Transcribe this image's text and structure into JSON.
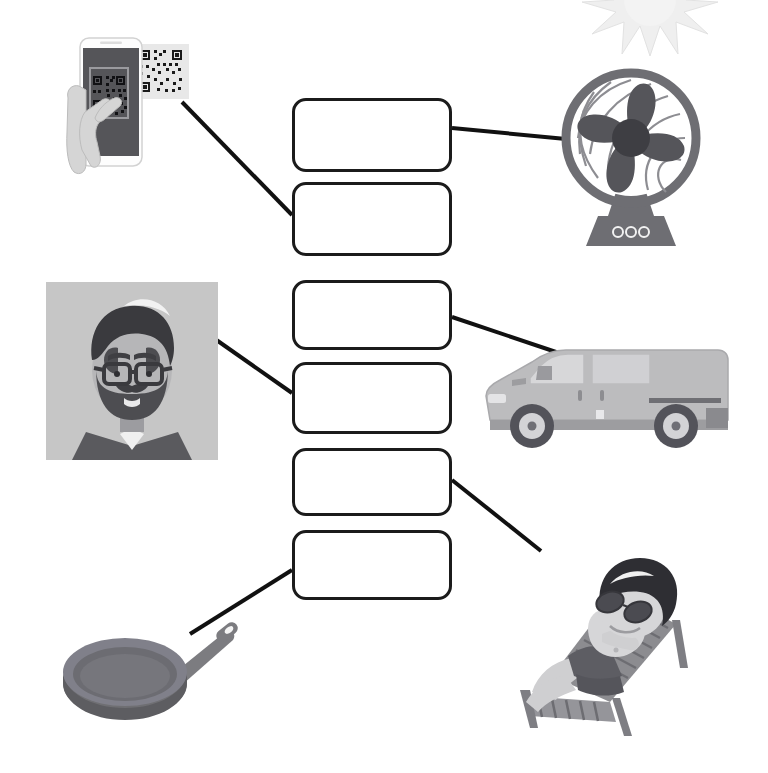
{
  "worksheet": {
    "title": "Matching exercise worksheet",
    "description": "Six empty rounded answer boxes arranged in a central column, joined by straight connector lines to six pictures: three on the left side and three on the right side.",
    "background_color": "#ffffff",
    "box_border_color": "#1b1b1b",
    "line_color": "#111111"
  },
  "answer_boxes": [
    {
      "id": "box-1",
      "label": "",
      "placeholder": "",
      "x": 292,
      "y": 98,
      "w": 160,
      "h": 74
    },
    {
      "id": "box-2",
      "label": "",
      "placeholder": "",
      "x": 292,
      "y": 182,
      "w": 160,
      "h": 74
    },
    {
      "id": "box-3",
      "label": "",
      "placeholder": "",
      "x": 292,
      "y": 280,
      "w": 160,
      "h": 70
    },
    {
      "id": "box-4",
      "label": "",
      "placeholder": "",
      "x": 292,
      "y": 362,
      "w": 160,
      "h": 72
    },
    {
      "id": "box-5",
      "label": "",
      "placeholder": "",
      "x": 292,
      "y": 448,
      "w": 160,
      "h": 68
    },
    {
      "id": "box-6",
      "label": "",
      "placeholder": "",
      "x": 292,
      "y": 530,
      "w": 160,
      "h": 70
    }
  ],
  "pictures": [
    {
      "id": "qr-phone",
      "name": "hand-scanning-qr-code-with-smartphone",
      "side": "left",
      "alt_text": "A hand holding a smartphone scanning a QR code",
      "x": 62,
      "y": 32,
      "w": 135,
      "h": 146
    },
    {
      "id": "hipster-man",
      "name": "bearded-man-with-glasses-portrait",
      "side": "left",
      "alt_text": "Portrait of a bearded man wearing glasses on a grey square",
      "x": 46,
      "y": 282,
      "w": 172,
      "h": 178
    },
    {
      "id": "frying-pan",
      "name": "frying-pan",
      "side": "left",
      "alt_text": "A grey frying pan seen at an angle",
      "x": 55,
      "y": 608,
      "w": 200,
      "h": 120
    },
    {
      "id": "sun",
      "name": "sun-star-burst",
      "side": "right",
      "alt_text": "A pale sun / star burst shape in the top right corner",
      "x": 585,
      "y": -18,
      "w": 130,
      "h": 70
    },
    {
      "id": "table-fan",
      "name": "electric-table-fan",
      "side": "right",
      "alt_text": "An electric table fan with four blades and a base with three buttons",
      "x": 560,
      "y": 60,
      "w": 140,
      "h": 190
    },
    {
      "id": "van",
      "name": "delivery-van",
      "side": "right",
      "alt_text": "A grey panel delivery van seen from the side",
      "x": 476,
      "y": 338,
      "w": 270,
      "h": 110
    },
    {
      "id": "sunbather",
      "name": "man-sunbathing-on-lounger",
      "side": "right",
      "alt_text": "A man with sunglasses sunbathing on a wooden deck chair",
      "x": 492,
      "y": 552,
      "w": 215,
      "h": 185
    }
  ],
  "connectors": [
    {
      "id": "line-qr-to-box2",
      "from": "qr-phone",
      "to": "box-2",
      "x1": 182,
      "y1": 102,
      "x2": 292,
      "y2": 215
    },
    {
      "id": "line-box1-to-fan",
      "from": "box-1",
      "to": "table-fan",
      "x1": 452,
      "y1": 128,
      "x2": 566,
      "y2": 138
    },
    {
      "id": "line-man-to-box4",
      "from": "hipster-man",
      "to": "box-4",
      "x1": 215,
      "y1": 339,
      "x2": 292,
      "y2": 393
    },
    {
      "id": "line-box3-to-van",
      "from": "box-3",
      "to": "van",
      "x1": 452,
      "y1": 317,
      "x2": 560,
      "y2": 353
    },
    {
      "id": "line-box5-to-chair",
      "from": "box-5",
      "to": "sunbather",
      "x1": 452,
      "y1": 480,
      "x2": 540,
      "y2": 550
    },
    {
      "id": "line-pan-to-box6",
      "from": "frying-pan",
      "to": "box-6",
      "x1": 190,
      "y1": 634,
      "x2": 292,
      "y2": 570
    }
  ]
}
